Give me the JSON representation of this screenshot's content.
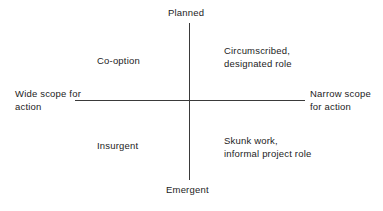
{
  "chart_data": {
    "type": "scatter",
    "title": "",
    "subtitle": "",
    "xlabel": "",
    "ylabel": "",
    "axes": {
      "vertical": {
        "top_label": "Planned",
        "bottom_label": "Emergent"
      },
      "horizontal": {
        "left_label": "Wide scope for\naction",
        "right_label": "Narrow scope\nfor action"
      }
    },
    "quadrants": [
      {
        "position": "top-left",
        "label": "Co-option",
        "vertical": "Planned",
        "horizontal": "Wide scope for action"
      },
      {
        "position": "top-right",
        "label": "Circumscribed,\ndesignated role",
        "vertical": "Planned",
        "horizontal": "Narrow scope for action"
      },
      {
        "position": "bottom-left",
        "label": "Insurgent",
        "vertical": "Emergent",
        "horizontal": "Wide scope for action"
      },
      {
        "position": "bottom-right",
        "label": "Skunk work,\ninformal project role",
        "vertical": "Emergent",
        "horizontal": "Narrow scope for action"
      }
    ],
    "grid": false,
    "legend": null,
    "colors": {
      "background": "#ffffff",
      "axis": "#3a3a3a",
      "text": "#1c1c1c"
    }
  }
}
